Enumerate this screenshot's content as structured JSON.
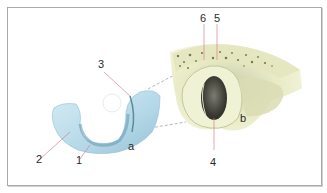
{
  "figure": {
    "panels": [
      {
        "id": "a",
        "label": "a",
        "description": "blue U-shaped cartilage structure"
      },
      {
        "id": "b",
        "label": "b",
        "description": "bone section with opening"
      }
    ],
    "callouts": [
      {
        "number": "1",
        "panel": "a"
      },
      {
        "number": "2",
        "panel": "a"
      },
      {
        "number": "3",
        "panel": "a"
      },
      {
        "number": "4",
        "panel": "b"
      },
      {
        "number": "5",
        "panel": "b"
      },
      {
        "number": "6",
        "panel": "b"
      }
    ],
    "colors": {
      "frame_border": "#a9a9a9",
      "leader_line": "#d9828f",
      "cartilage_light": "#c9e4ef",
      "cartilage_mid": "#9ec8da",
      "cartilage_dark": "#6e9fb4",
      "bone_light": "#eef0cf",
      "bone_mid": "#d5d9a8",
      "bone_dark": "#3a3a30",
      "dashed_line": "#8a9aa8"
    }
  }
}
